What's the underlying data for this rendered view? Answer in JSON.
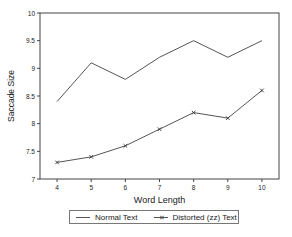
{
  "chart_data": {
    "type": "line",
    "title": "",
    "xlabel": "Word Length",
    "ylabel": "Saccade Size",
    "x": [
      4,
      5,
      6,
      7,
      8,
      9,
      10
    ],
    "xticks": [
      "4",
      "5",
      "6",
      "7",
      "8",
      "9",
      "10"
    ],
    "yticks": [
      "7",
      "7.5",
      "8",
      "8.5",
      "9",
      "9.5",
      "10"
    ],
    "xlim": [
      3.5,
      10.5
    ],
    "ylim": [
      7,
      10
    ],
    "grid": false,
    "legend_position": "bottom",
    "series": [
      {
        "name": "Normal Text",
        "marker": "none",
        "values": [
          8.4,
          9.1,
          8.8,
          9.2,
          9.5,
          9.2,
          9.5
        ]
      },
      {
        "name": "Distorted (zz) Text",
        "marker": "x",
        "values": [
          7.3,
          7.4,
          7.6,
          7.9,
          8.2,
          8.1,
          8.6
        ]
      }
    ]
  },
  "legend": {
    "items": [
      {
        "label": "Normal Text",
        "symbol": "line"
      },
      {
        "label": "Distorted (zz) Text",
        "symbol": "line-x"
      }
    ]
  },
  "colors": {
    "line": "#555555",
    "axis": "#444444"
  }
}
